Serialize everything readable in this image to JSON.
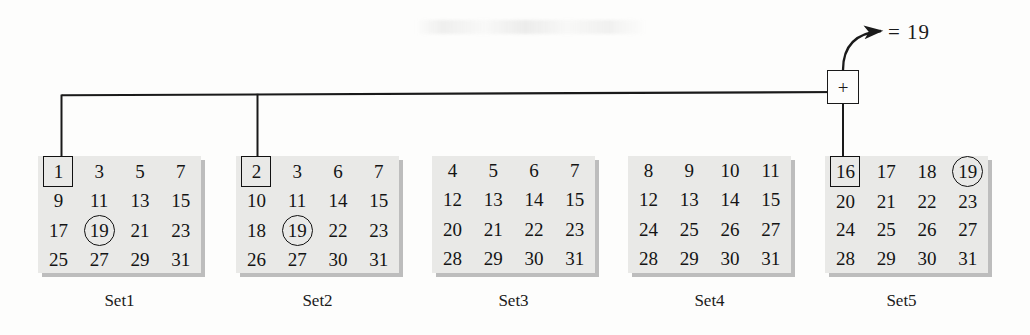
{
  "figure": {
    "result_label": "= 19",
    "adder_symbol": "+",
    "key": "19"
  },
  "sets": [
    {
      "caption": "Set1",
      "left": 38,
      "caption_left": 38,
      "values": [
        "1",
        "3",
        "5",
        "7",
        "9",
        "11",
        "13",
        "15",
        "17",
        "19",
        "21",
        "23",
        "25",
        "27",
        "29",
        "31"
      ],
      "boxed_index": 0,
      "circled_index": 9
    },
    {
      "caption": "Set2",
      "left": 236,
      "caption_left": 236,
      "values": [
        "2",
        "3",
        "6",
        "7",
        "10",
        "11",
        "14",
        "15",
        "18",
        "19",
        "22",
        "23",
        "26",
        "27",
        "30",
        "31"
      ],
      "boxed_index": 0,
      "circled_index": 9
    },
    {
      "caption": "Set3",
      "left": 432,
      "caption_left": 432,
      "values": [
        "4",
        "5",
        "6",
        "7",
        "12",
        "13",
        "14",
        "15",
        "20",
        "21",
        "22",
        "23",
        "28",
        "29",
        "30",
        "31"
      ],
      "boxed_index": -1,
      "circled_index": -1
    },
    {
      "caption": "Set4",
      "left": 628,
      "caption_left": 628,
      "values": [
        "8",
        "9",
        "10",
        "11",
        "12",
        "13",
        "14",
        "15",
        "24",
        "25",
        "26",
        "27",
        "28",
        "29",
        "30",
        "31"
      ],
      "boxed_index": -1,
      "circled_index": -1
    },
    {
      "caption": "Set5",
      "left": 825,
      "caption_left": 820,
      "values": [
        "16",
        "17",
        "18",
        "19",
        "20",
        "21",
        "22",
        "23",
        "24",
        "25",
        "26",
        "27",
        "28",
        "29",
        "30",
        "31"
      ],
      "boxed_index": 0,
      "circled_index": 3
    }
  ],
  "colors": {
    "ink": "#1a1a1a",
    "panel_fill": "#e9e9e7",
    "panel_shadow": "#969696",
    "page": "#fdfdfc"
  }
}
